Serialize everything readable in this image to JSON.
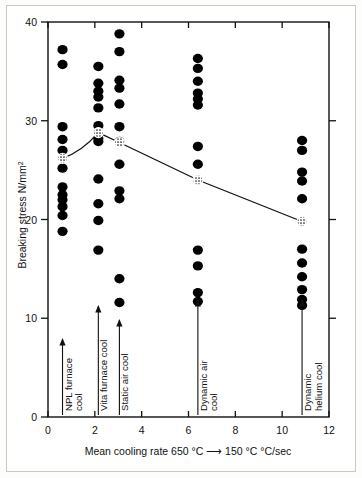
{
  "figure": {
    "background_color": "#ffffff",
    "frame_color": "#c9c9c4",
    "axis_color": "#111111",
    "marker_color": "#000000",
    "trend_line_color": "#111111"
  },
  "chart_data": {
    "type": "scatter",
    "title": "",
    "xlabel": "Mean cooling rate 650 °C ⟶ 150 °C   °C/sec",
    "ylabel": "Breaking stress N/mm²",
    "xlim": [
      0,
      12
    ],
    "ylim": [
      0,
      40
    ],
    "xticks": [
      0,
      2,
      4,
      6,
      8,
      10,
      12
    ],
    "xtick_labels": [
      "0",
      "2",
      "4",
      "6",
      "8",
      "10",
      "12"
    ],
    "yticks": [
      0,
      10,
      20,
      30,
      40
    ],
    "ytick_labels": [
      "0",
      "10",
      "20",
      "30",
      "40"
    ],
    "grid": false,
    "legend": "none",
    "box_frame": true,
    "series": [
      {
        "name": "NPL furnace cool",
        "x": 0.62,
        "values": [
          37.2,
          35.7,
          29.4,
          28.1,
          27.0,
          25.2,
          23.3,
          22.5,
          22.0,
          21.3,
          20.4,
          18.8
        ],
        "mean": 26.2,
        "label_lines": [
          "NPL furnace",
          "cool"
        ]
      },
      {
        "name": "Vita furnace cool",
        "x": 2.15,
        "values": [
          35.5,
          33.8,
          33.0,
          32.4,
          31.3,
          29.5,
          28.2,
          27.9,
          24.1,
          21.6,
          19.9,
          16.9
        ],
        "mean": 28.8,
        "label_lines": [
          "Vita furnace cool"
        ]
      },
      {
        "name": "Static air cool",
        "x": 3.05,
        "values": [
          38.8,
          37.0,
          34.1,
          33.3,
          31.7,
          29.4,
          27.9,
          25.6,
          22.9,
          22.1,
          14.0,
          11.6
        ],
        "mean": 27.8,
        "label_lines": [
          "Static air cool"
        ]
      },
      {
        "name": "Dynamic air cool",
        "x": 6.4,
        "values": [
          36.3,
          35.3,
          34.0,
          32.8,
          32.2,
          31.6,
          27.4,
          25.6,
          16.9,
          15.3,
          12.6,
          11.7
        ],
        "mean": 24.0,
        "label_lines": [
          "Dynamic air",
          "cool"
        ]
      },
      {
        "name": "Dynamic helium cool",
        "x": 10.85,
        "values": [
          28.0,
          27.0,
          24.8,
          23.9,
          22.1,
          17.0,
          15.6,
          14.2,
          12.9,
          11.9,
          11.3
        ],
        "mean": 19.8,
        "label_lines": [
          "Dynamic",
          "helium cool"
        ]
      }
    ],
    "trend_line": {
      "description": "line connecting group mean markers (stippled circles)",
      "points": [
        {
          "x": 0.62,
          "y": 26.2
        },
        {
          "x": 2.15,
          "y": 28.8
        },
        {
          "x": 3.05,
          "y": 27.8
        },
        {
          "x": 6.4,
          "y": 24.0
        },
        {
          "x": 10.85,
          "y": 19.8
        }
      ]
    },
    "group_arrows": [
      {
        "name": "NPL furnace cool",
        "x": 0.62
      },
      {
        "name": "Vita furnace cool",
        "x": 2.15
      },
      {
        "name": "Static air cool",
        "x": 3.05
      },
      {
        "name": "Dynamic air cool",
        "x": 6.4
      },
      {
        "name": "Dynamic helium cool",
        "x": 10.85
      }
    ]
  }
}
